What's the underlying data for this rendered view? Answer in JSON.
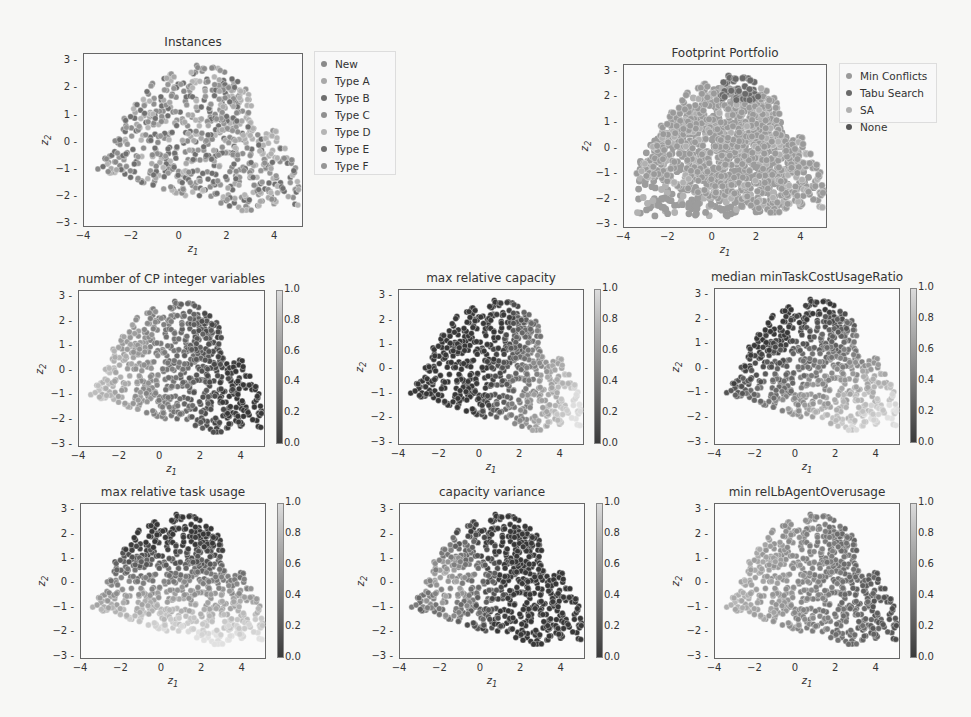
{
  "figure": {
    "panels": [
      {
        "id": "instances",
        "title": "Instances",
        "kind": "category",
        "box": [
          83,
          53,
          220,
          174
        ],
        "xlabel": "z_1",
        "ylabel": "z_2",
        "legend": {
          "box": [
            314,
            51,
            82,
            124
          ],
          "items": [
            {
              "label": "New",
              "color": "#8a8a8a"
            },
            {
              "label": "Type A",
              "color": "#a8a8a8"
            },
            {
              "label": "Type B",
              "color": "#6e6e6e"
            },
            {
              "label": "Type C",
              "color": "#8f8f8f"
            },
            {
              "label": "Type D",
              "color": "#b4b4b4"
            },
            {
              "label": "Type E",
              "color": "#707070"
            },
            {
              "label": "Type F",
              "color": "#959595"
            }
          ]
        }
      },
      {
        "id": "footprint",
        "title": "Footprint Portfolio",
        "kind": "footprint",
        "box": [
          623,
          64,
          204,
          164
        ],
        "xlabel": "z_1",
        "ylabel": "z_2",
        "legend": {
          "box": [
            839,
            63,
            98,
            60
          ],
          "items": [
            {
              "label": "Min Conflicts",
              "color": "#9a9a9a"
            },
            {
              "label": "Tabu Search",
              "color": "#6a6a6a"
            },
            {
              "label": "SA",
              "color": "#b0b0b0"
            },
            {
              "label": "None",
              "color": "#555555"
            }
          ]
        }
      },
      {
        "id": "cp_int_vars",
        "title": "number of CP integer variables",
        "kind": "gradient",
        "feature": "leftlight",
        "box": [
          78,
          290,
          187,
          157
        ],
        "xlabel": "z_1",
        "ylabel": "z_2",
        "cbar": [
          276,
          290,
          154
        ]
      },
      {
        "id": "max_rel_capacity",
        "title": "max relative capacity",
        "kind": "gradient",
        "feature": "rightlight",
        "box": [
          398,
          289,
          186,
          156
        ],
        "xlabel": "z_1",
        "ylabel": "z_2",
        "cbar": [
          594,
          289,
          155
        ]
      },
      {
        "id": "median_min_task_cost",
        "title": "median minTaskCostUsageRatio",
        "kind": "gradient",
        "feature": "bottomrightlight",
        "box": [
          714,
          288,
          186,
          157
        ],
        "xlabel": "z_1",
        "ylabel": "z_2",
        "cbar": [
          910,
          288,
          155
        ]
      },
      {
        "id": "max_rel_task_usage",
        "title": "max relative task usage",
        "kind": "gradient",
        "feature": "bottomlight",
        "box": [
          80,
          503,
          186,
          156
        ],
        "xlabel": "z_1",
        "ylabel": "z_2",
        "cbar": [
          277,
          503,
          155
        ]
      },
      {
        "id": "capacity_variance",
        "title": "capacity variance",
        "kind": "gradient",
        "feature": "mixed",
        "box": [
          399,
          503,
          186,
          156
        ],
        "xlabel": "z_1",
        "ylabel": "z_2",
        "cbar": [
          596,
          503,
          155
        ]
      },
      {
        "id": "min_rel_lb_agent",
        "title": "min relLbAgentOverusage",
        "kind": "gradient",
        "feature": "leftlight2",
        "box": [
          714,
          503,
          186,
          156
        ],
        "xlabel": "z_1",
        "ylabel": "z_2",
        "cbar": [
          910,
          503,
          155
        ]
      }
    ],
    "x_ticks": [
      "−4",
      "−2",
      "0",
      "2",
      "4"
    ],
    "y_ticks": [
      "3",
      "2",
      "1",
      "0",
      "−1",
      "−2",
      "−3"
    ],
    "cbar_ticks": [
      "1.0",
      "0.8",
      "0.6",
      "0.4",
      "0.2",
      "0.0"
    ]
  },
  "chart_data": [
    {
      "type": "scatter",
      "title": "Instances",
      "xlabel": "z1",
      "ylabel": "z2",
      "xlim": [
        -4,
        5.2
      ],
      "ylim": [
        -3.1,
        3.3
      ],
      "legend": [
        "New",
        "Type A",
        "Type B",
        "Type C",
        "Type D",
        "Type E",
        "Type F"
      ],
      "legend_position": "outside right",
      "note": "~1000 instance points in 2D projection, coloured by instance type"
    },
    {
      "type": "scatter",
      "title": "Footprint Portfolio",
      "xlabel": "z1",
      "ylabel": "z2",
      "xlim": [
        -4,
        5.2
      ],
      "ylim": [
        -3.1,
        3.3
      ],
      "legend": [
        "Min Conflicts",
        "Tabu Search",
        "SA",
        "None"
      ],
      "legend_position": "outside right",
      "note": "Min Conflicts covers most of space; Tabu Search cluster near z1∈[0.3,2], z2∈[2,3]"
    },
    {
      "type": "scatter",
      "title": "number of CP integer variables",
      "colorbar": [
        0,
        1
      ],
      "note": "higher values on left (z1<-1), lower on right"
    },
    {
      "type": "scatter",
      "title": "max relative capacity",
      "colorbar": [
        0,
        1
      ],
      "note": "higher values bottom-right (z1>1.5), low elsewhere"
    },
    {
      "type": "scatter",
      "title": "median minTaskCostUsageRatio",
      "colorbar": [
        0,
        1
      ],
      "note": "low top-left, high bottom-right"
    },
    {
      "type": "scatter",
      "title": "max relative task usage",
      "colorbar": [
        0,
        1
      ],
      "note": "high at bottom (z2<-1), low at top"
    },
    {
      "type": "scatter",
      "title": "capacity variance",
      "colorbar": [
        0,
        1
      ],
      "note": "high on left middle, low top-right"
    },
    {
      "type": "scatter",
      "title": "min relLbAgentOverusage",
      "colorbar": [
        0,
        1
      ],
      "note": "high on left, mid-low on right"
    }
  ]
}
